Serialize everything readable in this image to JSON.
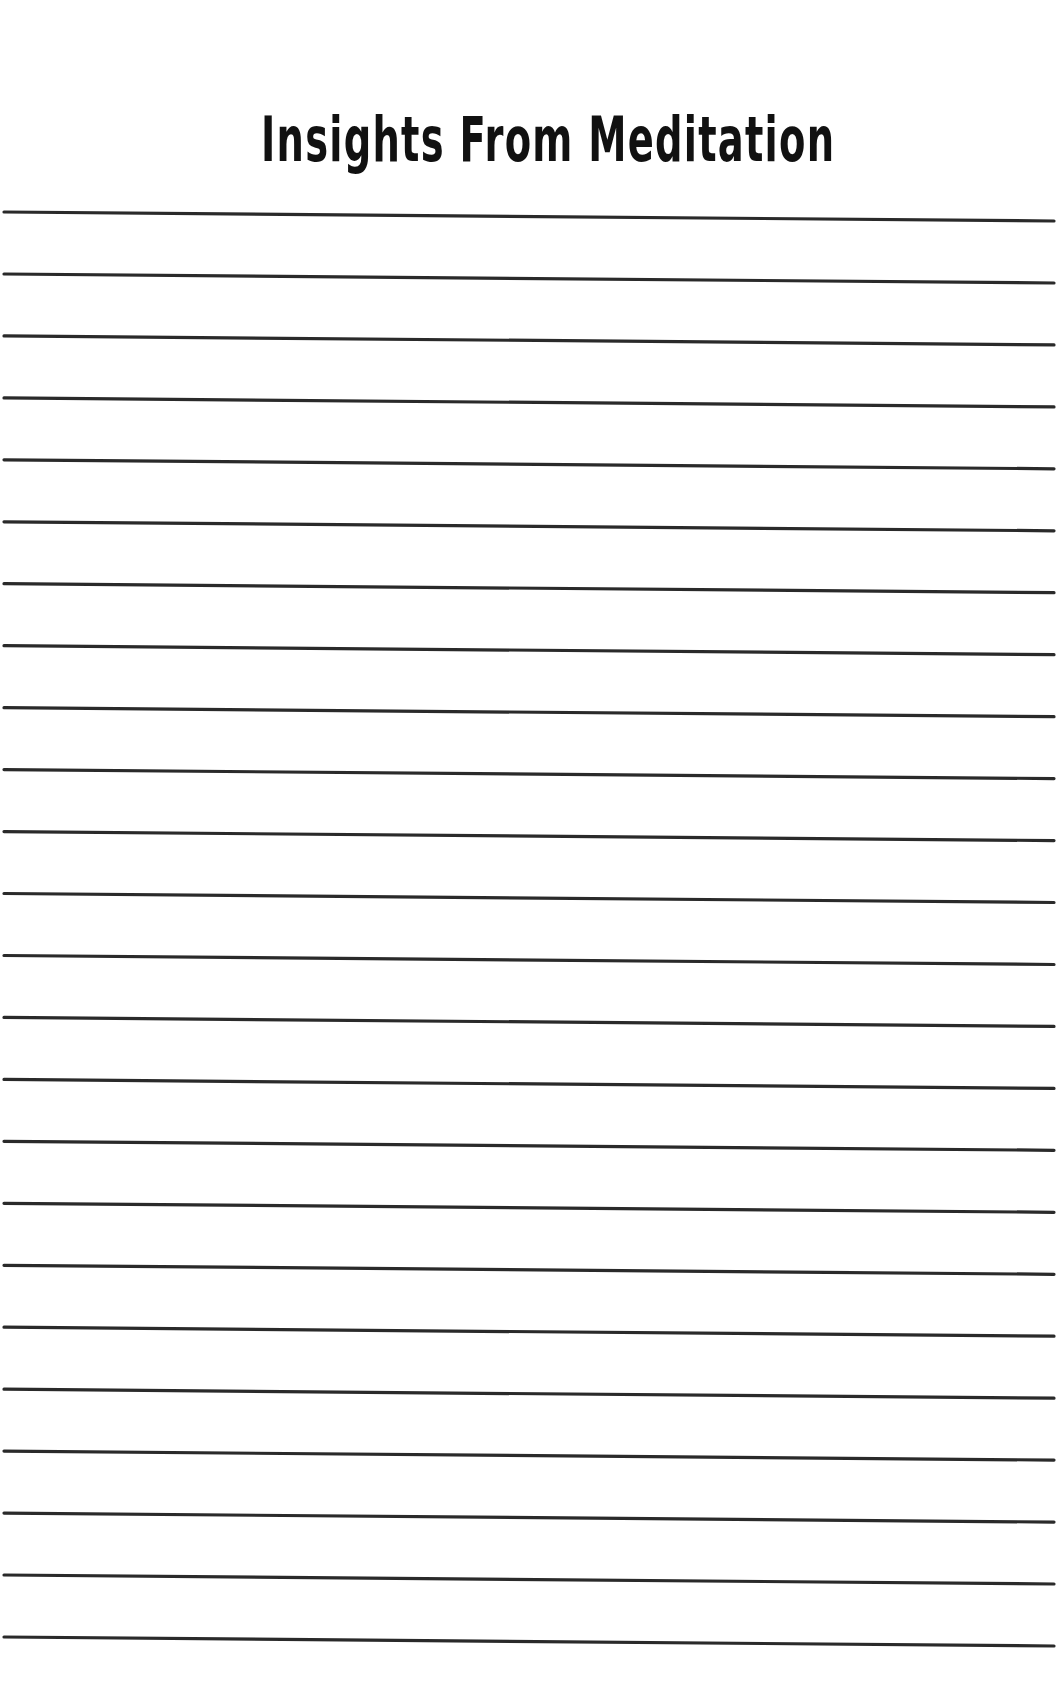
{
  "page": {
    "title": "Insights From Meditation",
    "ruled_line_count": 24,
    "line_color": "#2a2a2a",
    "background_color": "#ffffff"
  }
}
